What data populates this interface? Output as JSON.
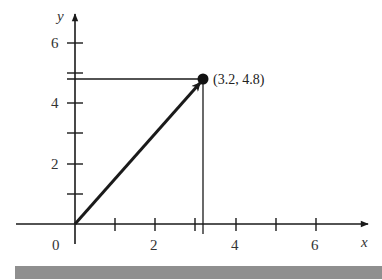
{
  "figure": {
    "type": "vector-diagram",
    "x_axis": {
      "label": "x",
      "tick_labels": [
        "0",
        "2",
        "4",
        "6"
      ]
    },
    "y_axis": {
      "label": "y",
      "tick_labels": [
        "2",
        "4",
        "6"
      ]
    },
    "point": {
      "x": 3.2,
      "y": 4.8,
      "label": "(3.2, 4.8)"
    },
    "vector": {
      "from": [
        0,
        0
      ],
      "to": [
        3.2,
        4.8
      ]
    },
    "colors": {
      "ink": "#1a1a1a",
      "bar": "#8f8f8f",
      "background": "#ffffff"
    }
  }
}
